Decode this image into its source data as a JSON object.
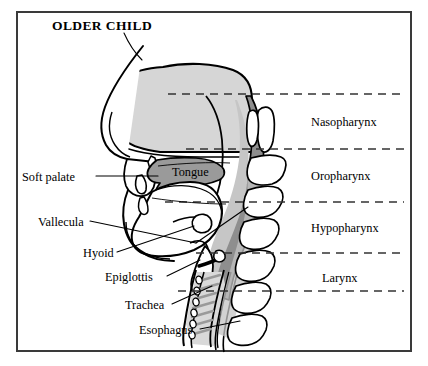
{
  "figure": {
    "title": "OLDER CHILD"
  },
  "left_labels": [
    {
      "id": "soft-palate",
      "text": "Soft palate",
      "x": 22,
      "y": 170
    },
    {
      "id": "vallecula",
      "text": "Vallecula",
      "x": 38,
      "y": 215
    },
    {
      "id": "hyoid",
      "text": "Hyoid",
      "x": 83,
      "y": 246
    },
    {
      "id": "epiglottis",
      "text": "Epiglottis",
      "x": 105,
      "y": 270
    },
    {
      "id": "trachea",
      "text": "Trachea",
      "x": 125,
      "y": 298
    },
    {
      "id": "esophagus",
      "text": "Esophagus",
      "x": 139,
      "y": 323
    }
  ],
  "inner_labels": [
    {
      "id": "tongue",
      "text": "Tongue",
      "x": 172,
      "y": 165
    }
  ],
  "region_labels": [
    {
      "id": "nasopharynx",
      "text": "Nasopharynx",
      "x": 311,
      "y": 115
    },
    {
      "id": "oropharynx",
      "text": "Oropharynx",
      "x": 311,
      "y": 169
    },
    {
      "id": "hypopharynx",
      "text": "Hypopharynx",
      "x": 311,
      "y": 221
    },
    {
      "id": "larynx",
      "text": "Larynx",
      "x": 322,
      "y": 271
    }
  ],
  "divider_lines": [
    {
      "id": "nasopharynx-top",
      "y": 94,
      "x1": 168,
      "x2": 404
    },
    {
      "id": "nasopharynx-bottom",
      "y": 149,
      "x1": 186,
      "x2": 404
    },
    {
      "id": "oropharynx-bottom",
      "y": 202,
      "x1": 165,
      "x2": 404
    },
    {
      "id": "hypopharynx-bottom",
      "y": 253,
      "x1": 196,
      "x2": 404
    },
    {
      "id": "larynx-bottom",
      "y": 291,
      "x1": 178,
      "x2": 404
    }
  ],
  "colors": {
    "frame": "#3a3a3a",
    "outline": "#000000",
    "skull_fill": "#d6d6d6",
    "airway_fill": "#c6c6c6",
    "pharynx_wall": "#8e8e8e",
    "soft_palate": "#9a9a9a",
    "tongue_fill": "#ffffff",
    "bone_fill": "#ffffff",
    "background": "#ffffff",
    "dash": "#333333"
  }
}
